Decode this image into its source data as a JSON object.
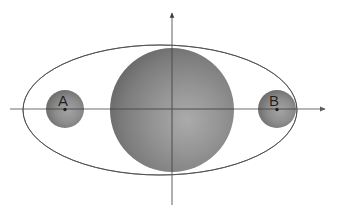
{
  "figure": {
    "kind": "orbital-diagram",
    "background_color": "#ffffff",
    "description_kind": "ellipse-with-central-sphere-and-two-orbiting-spheres"
  },
  "axes": {
    "color": "#6e6e6e",
    "origin": {
      "x": 172,
      "y": 109
    },
    "horizontal": {
      "name": "x-axis",
      "x_start": 10,
      "x_end": 327,
      "y": 109,
      "arrow_at": "right"
    },
    "vertical": {
      "name": "y-axis",
      "y_start": 11,
      "y_end": 205,
      "x": 172,
      "arrow_at": "top"
    }
  },
  "orbit": {
    "name": "elliptical-orbit",
    "center": {
      "x": 160,
      "y": 110
    },
    "radius_x": 137,
    "radius_y": 65,
    "stroke_color": "#5f5f5f",
    "stroke_width": 1,
    "fill": "none"
  },
  "central_body": {
    "name": "central-sphere",
    "center": {
      "x": 172,
      "y": 110
    },
    "radius": 62,
    "color_light": "#a2a2a2",
    "color_mid": "#838383",
    "color_dark": "#626262",
    "highlight": {
      "x_pct": 62,
      "y_pct": 58
    }
  },
  "orbiting_bodies": [
    {
      "id": "A",
      "label": "A",
      "name": "sphere-a",
      "center": {
        "x": 65,
        "y": 109
      },
      "radius": 19,
      "color_light": "#9a9a9a",
      "color_mid": "#848484",
      "color_dark": "#5f5f5f",
      "marker_color": "#1d1d1d",
      "marker_radius": 1.6,
      "label_color": "#1d1d1d"
    },
    {
      "id": "B",
      "label": "B",
      "name": "sphere-b",
      "center": {
        "x": 277,
        "y": 109
      },
      "radius": 19,
      "color_light": "#9a9a9a",
      "color_mid": "#848484",
      "color_dark": "#5f5f5f",
      "marker_color": "#1d1d1d",
      "marker_radius": 1.6,
      "label_color": "#1d1d1d"
    }
  ]
}
